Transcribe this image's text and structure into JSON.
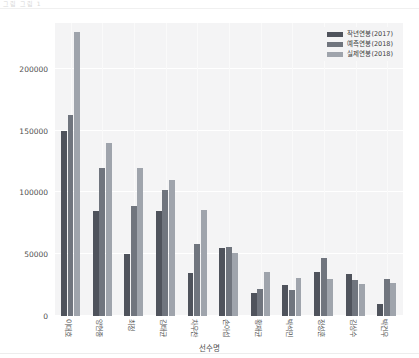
{
  "top_strip": {
    "ghost_text": "그림  그림 1"
  },
  "chart_data": {
    "type": "bar",
    "title": "",
    "xlabel": "선수명",
    "ylabel": "",
    "ylim": [
      0,
      237000
    ],
    "yticks": [
      0,
      50000,
      100000,
      150000,
      200000
    ],
    "ytick_labels": [
      "0",
      "50000",
      "100000",
      "150000",
      "200000"
    ],
    "grid": true,
    "legend_position": "upper right",
    "categories": [
      "이대호",
      "양현종",
      "최정",
      "김태균",
      "차우찬",
      "손아섭",
      "황재균",
      "박석민",
      "정성훈",
      "김상수",
      "박건우"
    ],
    "series": [
      {
        "name": "작년연봉(2017)",
        "color": "#4f535c",
        "values": [
          150000,
          85000,
          50000,
          85000,
          35000,
          55000,
          19000,
          25000,
          36000,
          34000,
          10000
        ]
      },
      {
        "name": "예측연봉(2018)",
        "color": "#70757e",
        "values": [
          163000,
          120000,
          89000,
          102000,
          58000,
          56000,
          22000,
          21000,
          47000,
          29000,
          30000
        ]
      },
      {
        "name": "실제연봉(2018)",
        "color": "#9fa4ac",
        "values": [
          230000,
          140000,
          120000,
          110000,
          86000,
          51000,
          36000,
          31000,
          30000,
          26000,
          27000
        ]
      }
    ]
  }
}
